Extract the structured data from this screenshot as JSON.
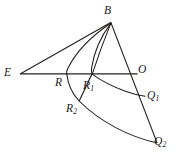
{
  "figure": {
    "kind": "geometry-diagram",
    "background_color": "#ffffff",
    "ink_color": "#23201f",
    "width": 175,
    "height": 159,
    "labels": {
      "b": "B",
      "e": "E",
      "o": "O",
      "r": "R",
      "r1_base": "R",
      "r1_sub": "1",
      "r2_base": "R",
      "r2_sub": "2",
      "q1_base": "Q",
      "q1_sub": "1",
      "q2_base": "Q",
      "q2_sub": "2"
    },
    "points": {
      "B": {
        "x": 111,
        "y": 22
      },
      "E": {
        "x": 20,
        "y": 74
      },
      "O": {
        "x": 136,
        "y": 74
      },
      "R": {
        "x": 67,
        "y": 74
      },
      "R1": {
        "x": 92,
        "y": 74
      },
      "R2": {
        "x": 79,
        "y": 101
      },
      "Q1": {
        "x": 145,
        "y": 96
      },
      "Q2": {
        "x": 157,
        "y": 143
      }
    },
    "label_positions": {
      "B": {
        "x": 104,
        "y": 5
      },
      "E": {
        "x": 4,
        "y": 67
      },
      "O": {
        "x": 138,
        "y": 64
      },
      "R": {
        "x": 55,
        "y": 77
      },
      "R1": {
        "x": 83,
        "y": 80
      },
      "R2": {
        "x": 66,
        "y": 103
      },
      "Q1": {
        "x": 147,
        "y": 90
      },
      "Q2": {
        "x": 154,
        "y": 136
      }
    },
    "segments": [
      {
        "name": "segment-e-b",
        "d": "M 20.5 73.8 L 110.8 22.4"
      },
      {
        "name": "segment-e-o",
        "d": "M 20.5 73.8 L 137.2 73.8"
      },
      {
        "name": "segment-b-q2",
        "d": "M 110.8 22.4 L 157.0 142.6"
      },
      {
        "name": "segment-r1-r2-chord",
        "d": "M 92.2 73.4 L 79.2 101.0"
      }
    ],
    "curves": [
      {
        "name": "curve-b-to-r",
        "d": "M 110.6 23.2 C 96.0 33.0 78.0 48.0 68.0 68.0 C 66.6 70.8 66.2 72.6 66.8 74.4"
      },
      {
        "name": "curve-b-to-r1",
        "d": "M 110.8 23.4 C 102.0 35.0 94.0 52.0 91.6 68.0 C 91.2 70.6 91.4 72.4 92.2 74.2"
      },
      {
        "name": "curve-r-to-r2-to-q2",
        "d": "M 66.8 74.4 C 68.0 84.0 72.0 93.5 79.2 101.0 C 100.0 122.0 130.0 137.0 156.6 142.8"
      },
      {
        "name": "curve-r1-to-q1",
        "d": "M 92.2 74.2 C 100.0 80.0 112.0 86.5 126.0 91.5 C 132.5 93.8 139.0 95.3 145.0 96.2"
      },
      {
        "name": "curve-b-lower-arc",
        "d": "M 110.8 23.4 C 104.0 40.0 97.5 58.0 92.4 73.6"
      }
    ]
  }
}
